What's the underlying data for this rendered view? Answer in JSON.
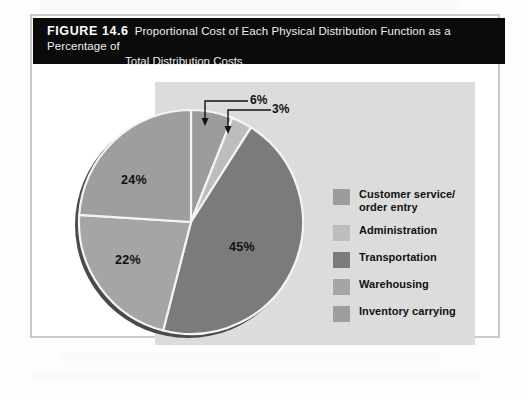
{
  "figure": {
    "label": "FIGURE 14.6",
    "title_line1": "Proportional Cost of Each Physical Distribution Function as a Percentage of",
    "title_line2": "Total Distribution Costs"
  },
  "chart_data": {
    "type": "pie",
    "title": "Proportional Cost of Each Physical Distribution Function as a Percentage of Total Distribution Costs",
    "unit": "%",
    "legend_position": "right",
    "grid": false,
    "categories": [
      "Customer service/ order entry",
      "Administration",
      "Transportation",
      "Warehousing",
      "Inventory carrying"
    ],
    "values": [
      6,
      3,
      45,
      22,
      24
    ],
    "labels": [
      "6%",
      "3%",
      "45%",
      "22%",
      "24%"
    ],
    "colors": [
      "#9c9c9c",
      "#b9b9b9",
      "#7b7b7b",
      "#a8a8a8",
      "#9f9f9f"
    ]
  },
  "pie": {
    "slices": [
      {
        "name": "customer-service",
        "label": "6%",
        "value": 6,
        "color": "#9c9c9c"
      },
      {
        "name": "administration",
        "label": "3%",
        "value": 3,
        "color": "#bdbdbd"
      },
      {
        "name": "transportation",
        "label": "45%",
        "value": 45,
        "color": "#7b7b7b"
      },
      {
        "name": "warehousing",
        "label": "22%",
        "value": 22,
        "color": "#a5a5a5"
      },
      {
        "name": "inventory",
        "label": "24%",
        "value": 24,
        "color": "#9e9e9e"
      }
    ],
    "callouts": [
      {
        "name": "callout-6",
        "label": "6%"
      },
      {
        "name": "callout-3",
        "label": "3%"
      }
    ],
    "shadow_color": "#4a4a4a",
    "separator_color": "#f4f4f4"
  },
  "legend": {
    "items": [
      {
        "label": "Customer service/",
        "label2": "order entry",
        "color": "#9c9c9c"
      },
      {
        "label": "Administration",
        "label2": "",
        "color": "#bdbdbd"
      },
      {
        "label": "Transportation",
        "label2": "",
        "color": "#7b7b7b"
      },
      {
        "label": "Warehousing",
        "label2": "",
        "color": "#a5a5a5"
      },
      {
        "label": "Inventory carrying",
        "label2": "",
        "color": "#9e9e9e"
      }
    ]
  },
  "colors": {
    "caption_bar": "#0b0b0b",
    "frame": "#c9c9c9",
    "panel": "#dcdcdc",
    "text": "#111111"
  }
}
